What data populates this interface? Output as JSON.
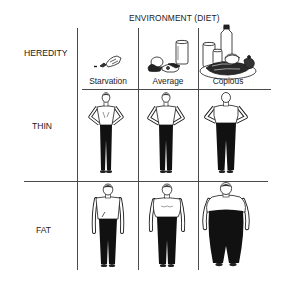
{
  "diagram": {
    "title": "ENVIRONMENT (DIET)",
    "row_header": "HEREDITY",
    "columns": [
      {
        "label": "Starvation",
        "food_icon": "sparse-food-icon"
      },
      {
        "label": "Average",
        "food_icon": "average-meal-icon"
      },
      {
        "label": "Copious",
        "food_icon": "copious-feast-icon"
      }
    ],
    "rows": [
      {
        "label": "THIN",
        "figures": [
          "thin-man-starvation",
          "thin-man-average",
          "thin-man-copious"
        ]
      },
      {
        "label": "FAT",
        "figures": [
          "stocky-man-starvation",
          "heavy-man-average",
          "obese-man-copious"
        ]
      }
    ],
    "colors": {
      "ink": "#1a1a1a",
      "grid": "#4a4a4a",
      "background": "#ffffff"
    }
  }
}
